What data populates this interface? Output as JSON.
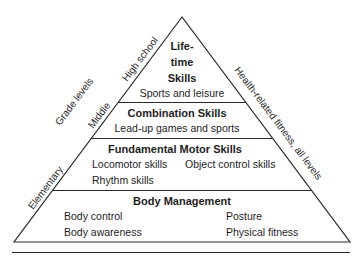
{
  "colors": {
    "line": "#2a2a2a",
    "text": "#1e1e1e",
    "background": "#ffffff"
  },
  "levels": {
    "lifetime": {
      "title_lines": [
        "Life-",
        "time",
        "Skills"
      ],
      "items": [
        "Sports and leisure"
      ]
    },
    "combination": {
      "title": "Combination Skills",
      "items": [
        "Lead-up games and sports"
      ]
    },
    "fundamental": {
      "title": "Fundamental Motor Skills",
      "items": [
        "Locomotor skills",
        "Object control skills",
        "Rhythm skills"
      ]
    },
    "body_management": {
      "title": "Body Management",
      "items": [
        "Body control",
        "Posture",
        "Body awareness",
        "Physical fitness"
      ]
    }
  },
  "left_labels": {
    "axis": "Grade levels",
    "high_school": "High school",
    "middle": "Middle",
    "elementary": "Elementary"
  },
  "right_label": "Health-related fitness, all levels"
}
